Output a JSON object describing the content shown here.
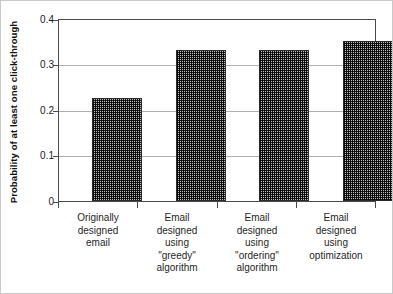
{
  "chart_data": {
    "type": "bar",
    "title": "",
    "xlabel": "",
    "ylabel": "Probability of at least one click-through",
    "ylim": [
      0,
      0.4
    ],
    "yticks": [
      "0",
      "0.1",
      "0.2",
      "0.3",
      "0.4"
    ],
    "ytick_values": [
      0,
      0.1,
      0.2,
      0.3,
      0.4
    ],
    "grid": true,
    "legend": "none",
    "categories": [
      "Originally designed email",
      "Email designed using \"greedy\" algorithm",
      "Email designed using \"ordering\" algorithm",
      "Email designed using optimization"
    ],
    "category_lines": [
      [
        "Originally",
        "designed",
        "email"
      ],
      [
        "Email",
        "designed",
        "using",
        "\"greedy\"",
        "algorithm"
      ],
      [
        "Email",
        "designed",
        "using",
        "\"ordering\"",
        "algorithm"
      ],
      [
        "Email",
        "designed",
        "using",
        "optimization"
      ]
    ],
    "values": [
      0.228,
      0.334,
      0.333,
      0.354
    ],
    "bar_color": "#6e6e6e",
    "bar_edge_color": "#2b2b2b",
    "axis_color": "#4a4a4a",
    "grid_color": "#b0b0b0"
  }
}
